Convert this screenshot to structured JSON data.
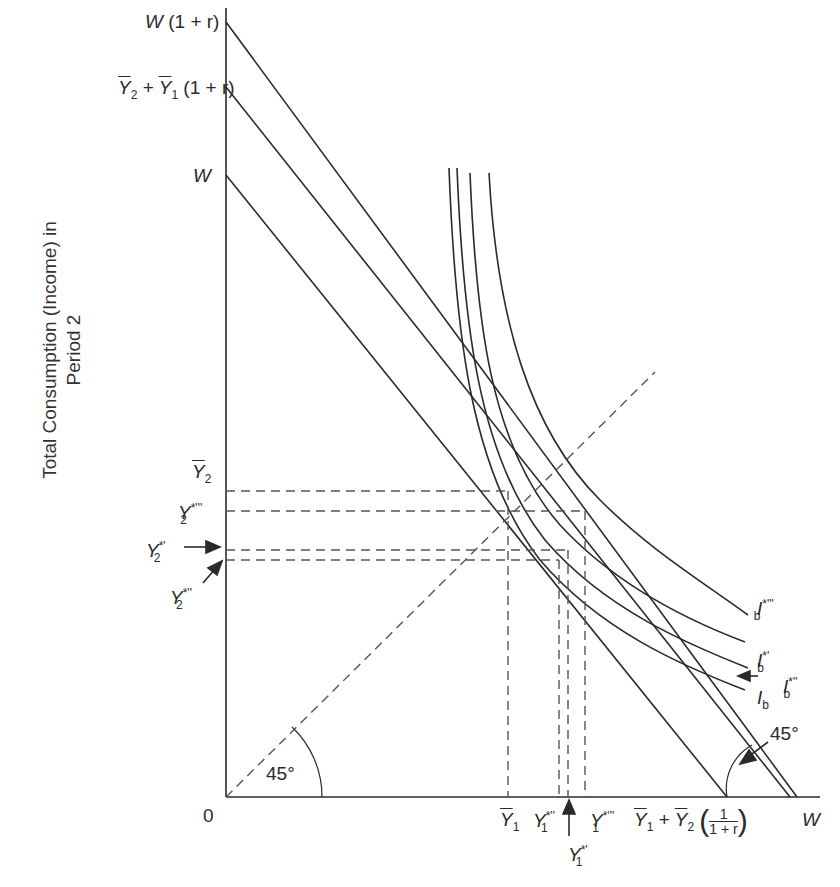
{
  "axes": {
    "y_label_line1": "Total Consumption (Income) in",
    "y_label_line2": "Period  2",
    "origin": "0"
  },
  "y_labels": {
    "w1r": {
      "main": "W",
      "rest": "(1 + r)"
    },
    "y2y1r": {
      "a": "Y",
      "a_sub": "2",
      "plus": "+",
      "b": "Y",
      "b_sub": "1",
      "rest": "(1 + r)"
    },
    "w": "W",
    "ybar2": {
      "main": "Y",
      "sub": "2"
    },
    "y2s3": {
      "main": "Y",
      "sup": "*'''",
      "sub": "2"
    },
    "y2s1": {
      "main": "Y",
      "sup": "*'",
      "sub": "2"
    },
    "y2s2": {
      "main": "Y",
      "sup": "*''",
      "sub": "2"
    }
  },
  "x_labels": {
    "ybar1": {
      "main": "Y",
      "sub": "1"
    },
    "y1s2": {
      "main": "Y",
      "sup": "*''",
      "sub": "1"
    },
    "y1s1": {
      "main": "Y",
      "sup": "*'",
      "sub": "1"
    },
    "y1s3": {
      "main": "Y",
      "sup": "*'''",
      "sub": "1"
    },
    "pv": {
      "a": "Y",
      "a_sub": "1",
      "plus": "+",
      "b": "Y",
      "b_sub": "2",
      "num": "1",
      "den": "1 + r"
    },
    "w": "W"
  },
  "curve_labels": {
    "ib3": {
      "main": "I",
      "sup": "*'''",
      "sub": "b"
    },
    "ib1": {
      "main": "I",
      "sup": "*'",
      "sub": "b"
    },
    "ib2": {
      "main": "I",
      "sup": "*''",
      "sub": "b"
    },
    "ib": {
      "main": "I",
      "sub": "b"
    }
  },
  "angles": {
    "left": "45°",
    "right": "45°"
  },
  "colors": {
    "ink": "#2a2a2a",
    "dash": "#555555",
    "background": "#ffffff"
  }
}
